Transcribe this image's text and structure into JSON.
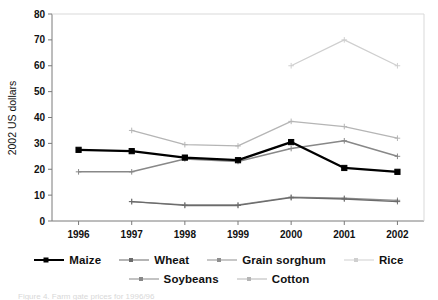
{
  "chart_data": {
    "type": "line",
    "title": "",
    "xlabel": "",
    "ylabel": "2002 US dollars",
    "categories": [
      "1996",
      "1997",
      "1998",
      "1999",
      "2000",
      "2001",
      "2002"
    ],
    "ylim": [
      0,
      80
    ],
    "yticks": [
      "0",
      "10",
      "20",
      "30",
      "40",
      "50",
      "60",
      "70",
      "80"
    ],
    "grid": false,
    "legend_position": "bottom",
    "series": [
      {
        "name": "Maize",
        "color": "#000000",
        "width": 2.3,
        "marker": "square",
        "values": [
          27.5,
          27,
          24.5,
          23.5,
          30.5,
          20.5,
          19
        ]
      },
      {
        "name": "Wheat",
        "color": "#6b6b6b",
        "width": 1.3,
        "marker": "cross",
        "values": [
          null,
          7.5,
          6,
          6,
          9,
          8.5,
          7.5
        ]
      },
      {
        "name": "Grain sorghum",
        "color": "#8f8f8f",
        "width": 1.3,
        "marker": "cross",
        "values": [
          null,
          7.5,
          6.2,
          6.2,
          9.2,
          8.8,
          8
        ]
      },
      {
        "name": "Rice",
        "color": "#cfcfcf",
        "width": 1.2,
        "marker": "cross",
        "values": [
          null,
          null,
          null,
          null,
          60,
          70,
          60
        ]
      },
      {
        "name": "Soybeans",
        "color": "#888888",
        "width": 1.5,
        "marker": "cross",
        "values": [
          19,
          19,
          24,
          23,
          28,
          31,
          25
        ]
      },
      {
        "name": "Cotton",
        "color": "#b5b5b5",
        "width": 1.3,
        "marker": "cross",
        "values": [
          null,
          35,
          29.5,
          29,
          38.5,
          36.5,
          32
        ]
      }
    ]
  },
  "legend": {
    "row1": [
      "Maize",
      "Wheat",
      "Grain sorghum",
      "Rice"
    ],
    "row2": [
      "Soybeans",
      "Cotton"
    ]
  },
  "caption": {
    "text": "Figure 4. Farm gate prices for 1996/96"
  }
}
